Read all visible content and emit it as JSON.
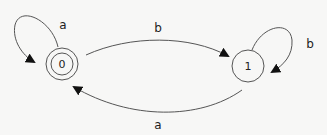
{
  "diagram": {
    "type": "finite-automaton",
    "states": [
      {
        "id": "0",
        "label": "0",
        "accepting": true,
        "x": 62,
        "y": 64
      },
      {
        "id": "1",
        "label": "1",
        "accepting": false,
        "x": 248,
        "y": 66
      }
    ],
    "transitions": [
      {
        "from": "0",
        "to": "0",
        "label": "a"
      },
      {
        "from": "0",
        "to": "1",
        "label": "b"
      },
      {
        "from": "1",
        "to": "1",
        "label": "b"
      },
      {
        "from": "1",
        "to": "0",
        "label": "a"
      }
    ]
  },
  "labels": {
    "state0": "0",
    "state1": "1",
    "loop0": "a",
    "edge01": "b",
    "loop1": "b",
    "edge10": "a"
  },
  "colors": {
    "stroke": "#555555",
    "text": "#222222",
    "background": "#f7f7f6"
  }
}
